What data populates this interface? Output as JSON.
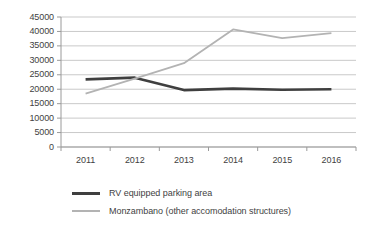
{
  "chart_data": {
    "type": "line",
    "title": "",
    "xlabel": "",
    "ylabel": "",
    "categories": [
      "2011",
      "2012",
      "2013",
      "2014",
      "2015",
      "2016"
    ],
    "ylim": [
      0,
      45000
    ],
    "ytick_labels": [
      "45000",
      "40000",
      "35000",
      "30000",
      "25000",
      "20000",
      "15000",
      "10000",
      "5000",
      "0"
    ],
    "ytick_values": [
      45000,
      40000,
      35000,
      30000,
      25000,
      20000,
      15000,
      10000,
      5000,
      0
    ],
    "grid": true,
    "legend_position": "bottom",
    "series": [
      {
        "name": "RV equipped parking area",
        "color": "#3f3f3f",
        "values": [
          23400,
          24000,
          19700,
          20200,
          19800,
          20000
        ]
      },
      {
        "name": "Monzambano (other accomodation structures)",
        "color": "#b3b3b3",
        "values": [
          18500,
          23700,
          29000,
          40700,
          37700,
          39400
        ]
      }
    ]
  },
  "legend": {
    "items": [
      {
        "label": "RV equipped parking area",
        "swatch": "dark-line-swatch"
      },
      {
        "label": "Monzambano (other accomodation structures)",
        "swatch": "light-line-swatch"
      }
    ]
  }
}
